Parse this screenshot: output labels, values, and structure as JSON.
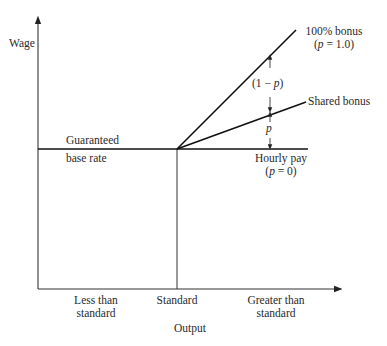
{
  "diagram": {
    "y_axis_label": "Wage",
    "x_axis_label": "Output",
    "x_ticks": [
      {
        "line1": "Less than",
        "line2": "standard"
      },
      {
        "line1": "Standard",
        "line2": ""
      },
      {
        "line1": "Greater than",
        "line2": "standard"
      }
    ],
    "base_label_line1": "Guaranteed",
    "base_label_line2": "base rate",
    "lines": [
      {
        "name": "100% bonus",
        "param": "(p = 1.0)"
      },
      {
        "name": "Shared bonus",
        "param": ""
      },
      {
        "name": "Hourly pay",
        "param": "(p = 0)"
      }
    ],
    "gap_upper_label": "(1 − p)",
    "gap_lower_label": "p"
  }
}
